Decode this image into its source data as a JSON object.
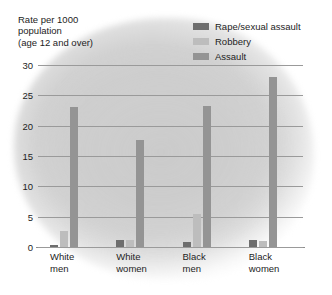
{
  "chart_data": {
    "type": "bar",
    "title": "",
    "subtitle": "",
    "ylabel": "Rate per 1000\npopulation\n(age 12 and over)",
    "xlabel": "",
    "categories": [
      "White\nmen",
      "White\nwomen",
      "Black\nmen",
      "Black\nwomen"
    ],
    "ylim": [
      0,
      30
    ],
    "yticks": [
      0,
      5,
      10,
      15,
      20,
      25,
      30
    ],
    "ytick_labels": [
      "0",
      "5",
      "10",
      "15",
      "20",
      "25",
      "30"
    ],
    "grid": true,
    "legend_position": "top-right",
    "series": [
      {
        "name": "Rape/sexual assault",
        "color": "#6e6e6e",
        "values": [
          0.3,
          1.1,
          0.8,
          1.2
        ]
      },
      {
        "name": "Robbery",
        "color": "#bdbdbd",
        "values": [
          2.6,
          1.1,
          5.5,
          1.0
        ]
      },
      {
        "name": "Assault",
        "color": "#949494",
        "values": [
          23.0,
          17.6,
          23.3,
          28.0
        ]
      }
    ]
  },
  "colors": {
    "background": "#ffffff",
    "plot_wash": "#cfcfcf",
    "gridline": "#9a9a9a",
    "text": "#1d1d1d"
  }
}
